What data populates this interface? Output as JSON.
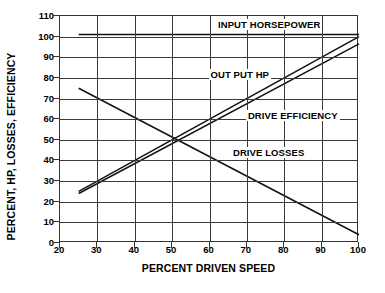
{
  "chart_data": {
    "type": "line",
    "title": "",
    "xlabel": "PERCENT DRIVEN SPEED",
    "ylabel": "PERCENT, HP, LOSSES, EFFICIENCY",
    "xlim": [
      20,
      100
    ],
    "ylim": [
      0,
      110
    ],
    "xticks": [
      20,
      30,
      40,
      50,
      60,
      70,
      80,
      90,
      100
    ],
    "yticks": [
      0,
      10,
      20,
      30,
      40,
      50,
      60,
      70,
      80,
      90,
      100,
      110
    ],
    "grid": true,
    "legend_position": "inline-annotations",
    "series": [
      {
        "name": "INPUT HORSEPOWER",
        "label": "INPUT HORSEPOWER",
        "x": [
          25,
          100
        ],
        "values": [
          101,
          101
        ],
        "label_x": 62,
        "label_y": 105
      },
      {
        "name": "OUT PUT HP",
        "label": "OUT PUT HP",
        "x": [
          25,
          100
        ],
        "values": [
          24,
          96.5
        ],
        "label_x": 60,
        "label_y": 81
      },
      {
        "name": "DRIVE EFFICIENCY",
        "label": "DRIVE EFFICIENCY",
        "x": [
          25,
          100
        ],
        "values": [
          25,
          100
        ],
        "label_x": 70,
        "label_y": 61
      },
      {
        "name": "DRIVE LOSSES",
        "label": "DRIVE LOSSES",
        "x": [
          25,
          100
        ],
        "values": [
          75,
          4
        ],
        "label_x": 66,
        "label_y": 43
      }
    ]
  },
  "axes": {
    "x_title": "PERCENT DRIVEN SPEED",
    "y_title": "PERCENT, HP, LOSSES, EFFICIENCY",
    "x_tick_labels": [
      "20",
      "30",
      "40",
      "50",
      "60",
      "70",
      "80",
      "90",
      "100"
    ],
    "y_tick_labels": [
      "0",
      "10",
      "20",
      "30",
      "40",
      "50",
      "60",
      "70",
      "80",
      "90",
      "100",
      "110"
    ]
  },
  "colors": {
    "line": "#111111",
    "grid": "#3a3a3a",
    "frame": "#333333",
    "background": "#ffffff"
  }
}
